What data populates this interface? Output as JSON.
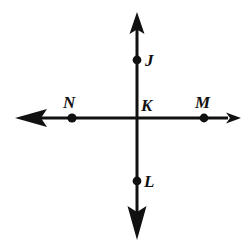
{
  "figure": {
    "background_color": "#ffffff",
    "stroke_color": "#111111",
    "canvas": {
      "width": 250,
      "height": 250
    },
    "intersection": {
      "x": 137,
      "y": 118
    },
    "lines": [
      {
        "name": "vertical-line",
        "orientation": "vertical",
        "from": {
          "x": 137,
          "y": 14
        },
        "to": {
          "x": 137,
          "y": 238
        },
        "arrowheads": "both"
      },
      {
        "name": "horizontal-line",
        "orientation": "horizontal",
        "from": {
          "x": 16,
          "y": 118
        },
        "to": {
          "x": 240,
          "y": 118
        },
        "arrowheads": "both"
      }
    ],
    "points": [
      {
        "id": "J",
        "label": "J",
        "dot": {
          "x": 137,
          "y": 60
        },
        "label_pos": {
          "x": 145,
          "y": 52
        },
        "on_line": "vertical-line"
      },
      {
        "id": "K",
        "label": "K",
        "dot": null,
        "label_pos": {
          "x": 141,
          "y": 97
        },
        "on_line": "intersection"
      },
      {
        "id": "M",
        "label": "M",
        "dot": {
          "x": 204,
          "y": 118
        },
        "label_pos": {
          "x": 195,
          "y": 94
        },
        "on_line": "horizontal-line"
      },
      {
        "id": "N",
        "label": "N",
        "dot": {
          "x": 72,
          "y": 118
        },
        "label_pos": {
          "x": 63,
          "y": 94
        },
        "on_line": "horizontal-line"
      },
      {
        "id": "L",
        "label": "L",
        "dot": {
          "x": 137,
          "y": 181
        },
        "label_pos": {
          "x": 144,
          "y": 173
        },
        "on_line": "vertical-line"
      }
    ],
    "dot_radius": 4.4,
    "line_width": 3
  }
}
